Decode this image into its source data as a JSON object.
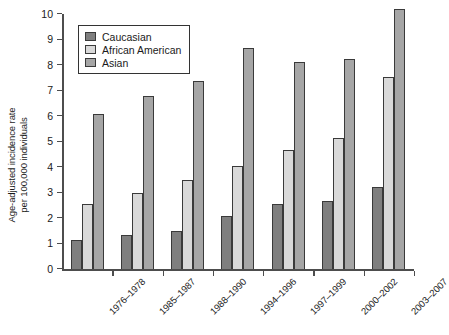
{
  "chart_data": {
    "type": "bar",
    "title": "",
    "xlabel": "",
    "ylabel": "Age-adjusted incidence rate\nper 100,000 individuals",
    "ylabel_line1": "Age-adjusted incidence rate",
    "ylabel_line2": "per 100,000 individuals",
    "categories": [
      "1976–1978",
      "1985–1987",
      "1988–1990",
      "1994–1996",
      "1997–1999",
      "2000–2002",
      "2003–2007"
    ],
    "series": [
      {
        "name": "Caucasian",
        "color": "#7f7f7f",
        "values": [
          1.15,
          1.35,
          1.5,
          2.1,
          2.55,
          2.7,
          3.25
        ]
      },
      {
        "name": "African American",
        "color": "#d9d9d9",
        "values": [
          2.55,
          3.0,
          3.5,
          4.05,
          4.7,
          5.15,
          7.55
        ]
      },
      {
        "name": "Asian",
        "color": "#a6a6a6",
        "values": [
          6.1,
          6.8,
          7.4,
          8.7,
          8.15,
          8.25,
          10.2
        ]
      }
    ],
    "ylim": [
      0,
      10
    ],
    "yticks": [
      0,
      1,
      2,
      3,
      4,
      5,
      6,
      7,
      8,
      9,
      10
    ],
    "ytick_labels": [
      "0",
      "1",
      "2",
      "3",
      "4",
      "5",
      "6",
      "7",
      "8",
      "9",
      "10"
    ],
    "grid": false,
    "legend_position": "top-left",
    "legend_entries": [
      "Caucasian",
      "African American",
      "Asian"
    ]
  }
}
